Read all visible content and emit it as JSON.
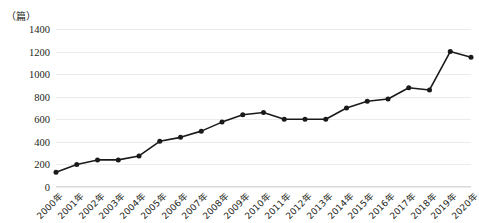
{
  "chart": {
    "unit_label": "（篇）",
    "y_axis_ticks": [
      "0",
      "200",
      "400",
      "600",
      "800",
      "1000",
      "1200",
      "1400"
    ]
  },
  "chart_data": {
    "type": "line",
    "title": "",
    "subtitle": "",
    "xlabel": "",
    "ylabel": "（篇）",
    "ylim": [
      0,
      1400
    ],
    "ytick_step": 200,
    "grid": true,
    "legend": "none",
    "marker": "filled-circle",
    "line_color": "#1a1a1a",
    "marker_color": "#1a1a1a",
    "grid_color": "#ebebeb",
    "categories": [
      "2000年",
      "2001年",
      "2002年",
      "2003年",
      "2004年",
      "2005年",
      "2006年",
      "2007年",
      "2008年",
      "2009年",
      "2010年",
      "2011年",
      "2012年",
      "2013年",
      "2014年",
      "2015年",
      "2016年",
      "2017年",
      "2018年",
      "2019年",
      "2020年"
    ],
    "values": [
      130,
      200,
      240,
      240,
      275,
      405,
      440,
      495,
      575,
      640,
      660,
      600,
      600,
      600,
      700,
      760,
      780,
      880,
      860,
      1200,
      1150
    ]
  }
}
